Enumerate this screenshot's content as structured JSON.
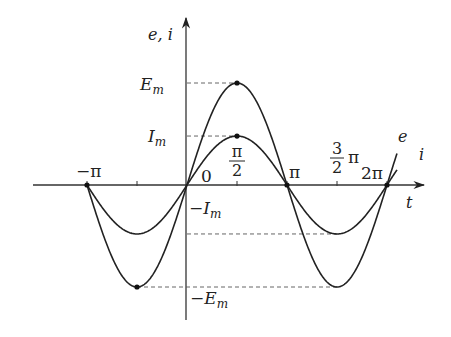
{
  "diagram": {
    "axes": {
      "y_label": "e, i",
      "x_label": "t"
    },
    "x_ticks": [
      {
        "label": "−π",
        "value_pi": -1
      },
      {
        "label": "",
        "value_pi": -0.5
      },
      {
        "label": "0",
        "value_pi": 0
      },
      {
        "label_num": "π",
        "label_den": "2",
        "value_pi": 0.5
      },
      {
        "label": "π",
        "value_pi": 1
      },
      {
        "label_num": "3",
        "label_den": "2",
        "label_suffix": "π",
        "value_pi": 1.5
      },
      {
        "label": "2π",
        "value_pi": 2
      }
    ],
    "y_levels": {
      "Em": {
        "label": "E",
        "sub": "m",
        "relative": 1.0
      },
      "Im": {
        "label": "I",
        "sub": "m",
        "relative": 0.48
      },
      "neg_Im": {
        "label": "−I",
        "sub": "m"
      },
      "neg_Em": {
        "label": "−E",
        "sub": "m"
      }
    },
    "curves": [
      {
        "name": "e",
        "label": "e",
        "amplitude_relative": 1.0,
        "phase": 0
      },
      {
        "name": "i",
        "label": "i",
        "amplitude_relative": 0.48,
        "phase": 0
      }
    ],
    "domain_pi": [
      -1,
      2.1
    ]
  }
}
